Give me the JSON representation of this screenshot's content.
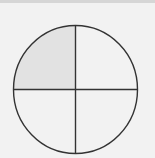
{
  "diagram": {
    "type": "fraction-circle",
    "total_parts": 4,
    "shaded_parts": 1,
    "shaded_quadrant": "top-left",
    "fraction": "1/4",
    "colors": {
      "background": "#f2f2f2",
      "shaded": "#e2e2e2",
      "unshaded": "#f4f4f4",
      "stroke": "#333333"
    }
  }
}
